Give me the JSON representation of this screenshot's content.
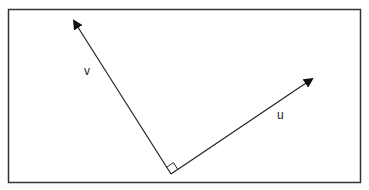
{
  "diagram": {
    "frame": {
      "x": 8,
      "y": 9,
      "width": 353,
      "height": 174,
      "stroke": "#333333"
    },
    "origin": {
      "x": 171,
      "y": 174
    },
    "vectors": [
      {
        "name": "v",
        "label": "v",
        "tip": {
          "x": 73,
          "y": 19
        },
        "label_pos": {
          "x": 87,
          "y": 75
        }
      },
      {
        "name": "u",
        "label": "u",
        "tip": {
          "x": 314,
          "y": 78
        },
        "label_pos": {
          "x": 280,
          "y": 119
        }
      }
    ],
    "right_angle_marker": true,
    "line_color": "#222222"
  }
}
